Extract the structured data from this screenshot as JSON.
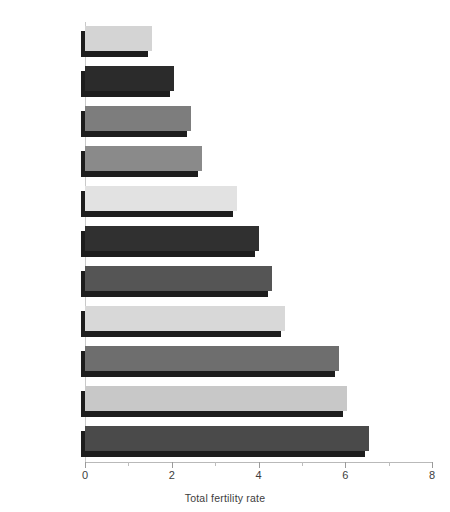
{
  "chart_data": {
    "type": "bar",
    "orientation": "horizontal",
    "title": "",
    "xlabel": "Total fertility rate",
    "ylabel": "",
    "xlim": [
      0,
      8
    ],
    "xticks": [
      0,
      2,
      4,
      6,
      8
    ],
    "xtick_labels": [
      "0",
      "2",
      "4",
      "6",
      "8"
    ],
    "xminorticks": [
      1,
      3,
      5,
      7
    ],
    "grid": false,
    "legend": false,
    "categories": [
      "Singapore",
      "South Kore",
      "Sri Lanka",
      "Thailand",
      "Indonesia",
      "Malaysia",
      "India",
      "Phillppines",
      "Bangladesh",
      "Nepal",
      "Pakistan"
    ],
    "values": [
      1.55,
      2.05,
      2.45,
      2.7,
      3.5,
      4.0,
      4.3,
      4.6,
      5.85,
      6.05,
      6.55
    ],
    "bar_colors": [
      "#d4d4d4",
      "#2b2b2b",
      "#7d7d7d",
      "#8a8a8a",
      "#e2e2e2",
      "#303030",
      "#555555",
      "#d8d8d8",
      "#6e6e6e",
      "#c8c8c8",
      "#4a4a4a"
    ],
    "shadow_color": "#1d1d1d",
    "axis_color": "#c9c9c9",
    "text_color": "#3d3d3d",
    "background": "#ffffff"
  },
  "axis": {
    "x_title": "Total fertility rate"
  },
  "top_caption": ""
}
